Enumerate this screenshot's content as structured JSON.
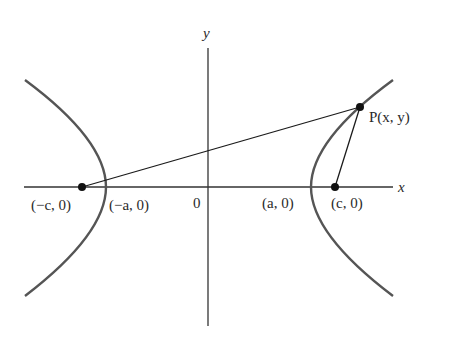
{
  "figure": {
    "axes": {
      "x_label": "x",
      "y_label": "y",
      "origin_label": "0"
    },
    "points": {
      "left_focus": "(−c, 0)",
      "left_vertex": "(−a, 0)",
      "right_vertex": "(a, 0)",
      "right_focus": "(c, 0)",
      "point_p": "P(x, y)"
    },
    "colors": {
      "curve": "#555555",
      "axis": "#333333",
      "line": "#1a1a1a",
      "dot": "#111111"
    }
  }
}
